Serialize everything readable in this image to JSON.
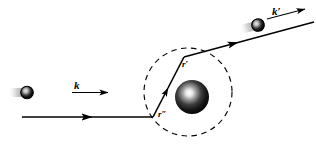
{
  "figure": {
    "kind": "scattering-diagram",
    "background_color": "#ffffff",
    "stroke_color": "#000000",
    "labels": {
      "incident_wavevector": "k",
      "scattered_wavevector": "k′",
      "position_vector_primed": "r′",
      "position_vector_double_primed": "r″"
    },
    "elements": {
      "incident_ray_name": "incident-ray",
      "scattered_ray_name": "scattered-ray",
      "scatterer_name": "central-sphere",
      "boundary_name": "dashed-boundary-circle",
      "incident_particle_name": "incident-particle",
      "scattered_particle_name": "scattered-particle"
    },
    "geometry": {
      "circle_center_x": 188,
      "circle_center_y": 92,
      "circle_radius": 44,
      "sphere_center_x": 192,
      "sphere_center_y": 97,
      "sphere_radius": 17,
      "vertex_bottom_x": 153,
      "vertex_bottom_y": 117,
      "vertex_top_x": 184,
      "vertex_top_y": 57,
      "incident_ray_y": 117,
      "incident_ray_x_start": 22,
      "scattered_ray_x_end": 314,
      "scattered_ray_y_end": 22
    },
    "colors": {
      "ink": "#000000",
      "sphere_dark": "#111111",
      "sphere_highlight": "#f2f2f2",
      "particle_tail": "#b9b9b9",
      "paper": "#ffffff"
    }
  }
}
